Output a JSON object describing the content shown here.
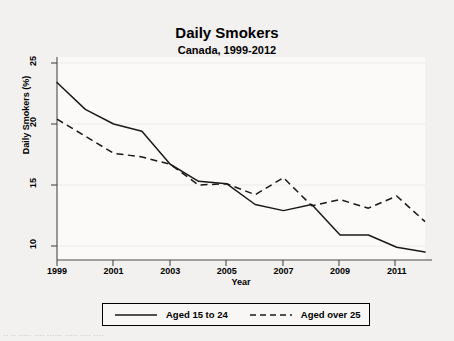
{
  "chart_data": {
    "type": "line",
    "title": "Daily Smokers",
    "subtitle": "Canada, 1999-2012",
    "xlabel": "Year",
    "ylabel": "Daily Smokers (%)",
    "x": [
      1999,
      2000,
      2001,
      2002,
      2003,
      2004,
      2005,
      2006,
      2007,
      2008,
      2009,
      2010,
      2011,
      2012
    ],
    "xlim": [
      1999,
      2012
    ],
    "ylim": [
      9.2,
      25.4
    ],
    "xticks": [
      1999,
      2001,
      2003,
      2005,
      2007,
      2009,
      2011
    ],
    "xtick_labels": [
      "1999",
      "2001",
      "2003",
      "2005",
      "2007",
      "2009",
      "2011"
    ],
    "yticks": [
      10,
      15,
      20,
      25
    ],
    "ytick_labels": [
      "10",
      "15",
      "20",
      "25"
    ],
    "grid": false,
    "legend_position": "bottom",
    "series": [
      {
        "name": "Aged 15 to 24",
        "style": "solid",
        "color": "#1a1a1a",
        "values": [
          23.4,
          21.2,
          20.0,
          19.4,
          16.7,
          15.3,
          15.1,
          13.4,
          12.9,
          13.4,
          10.9,
          10.9,
          9.9,
          9.5
        ]
      },
      {
        "name": "Aged over 25",
        "style": "dashed",
        "color": "#1a1a1a",
        "values": [
          20.4,
          19.0,
          17.6,
          17.3,
          16.7,
          15.0,
          15.1,
          14.2,
          15.6,
          13.3,
          13.8,
          13.1,
          14.1,
          12.0
        ]
      }
    ]
  },
  "legend": {
    "entries": [
      {
        "label": "Aged 15 to 24",
        "style": "solid"
      },
      {
        "label": "Aged over 25",
        "style": "dashed"
      }
    ]
  },
  "caption": {
    "text": "·· ·· ····· ···· ······ ····· ···· ····"
  },
  "colors": {
    "background": "#f2f1ef",
    "axis": "#4a4a4a",
    "line": "#1a1a1a",
    "plot_background": "#fbfaf8"
  }
}
